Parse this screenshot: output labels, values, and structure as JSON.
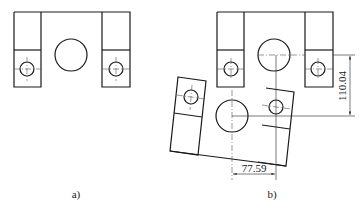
{
  "figure_a": {
    "label": "a)",
    "description": "Part with two slotted bosses and a central bore, original position"
  },
  "figure_b": {
    "label": "b)",
    "description": "Same part shown in original and rotated position with dimensions",
    "dimensions": {
      "vertical": "110.04",
      "horizontal": "77.59"
    }
  },
  "colors": {
    "line": "#1a1a1a",
    "background": "#ffffff"
  }
}
